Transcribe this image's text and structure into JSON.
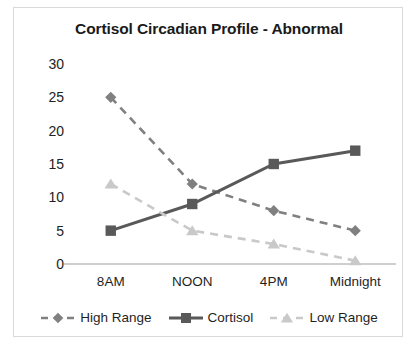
{
  "chart_data": {
    "type": "line",
    "title": "Cortisol Circadian Profile - Abnormal",
    "xlabel": "",
    "ylabel": "",
    "categories": [
      "8AM",
      "NOON",
      "4PM",
      "Midnight"
    ],
    "series": [
      {
        "name": "High Range",
        "values": [
          25,
          12,
          8,
          5
        ],
        "color": "#808080",
        "line_style": "dashed",
        "marker": "diamond"
      },
      {
        "name": "Cortisol",
        "values": [
          5,
          9,
          15,
          17
        ],
        "color": "#595959",
        "line_style": "solid",
        "marker": "square"
      },
      {
        "name": "Low Range",
        "values": [
          12,
          5,
          3,
          0.5
        ],
        "color": "#c9c9c9",
        "line_style": "dashed",
        "marker": "triangle"
      }
    ],
    "ylim": [
      0,
      30
    ],
    "yticks": [
      0,
      5,
      10,
      15,
      20,
      25,
      30
    ],
    "ytick_labels": [
      "0",
      "5",
      "10",
      "15",
      "20",
      "25",
      "30"
    ],
    "grid": false,
    "legend_position": "bottom",
    "axis_color": "#bfbfbf",
    "frame_color": "#d9d9d9",
    "background": "#ffffff",
    "title_color": "#1a1a1a"
  }
}
